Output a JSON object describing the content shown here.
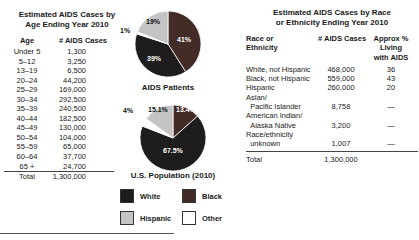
{
  "age_table": {
    "title": "Estimated AIDS Cases by\nAge Ending Year 2010",
    "col_age": "Age",
    "col_cases": "# AIDS Cases",
    "rows": [
      {
        "age": "Under 5",
        "cases": "1,300"
      },
      {
        "age": "5–12",
        "cases": "3,250"
      },
      {
        "age": "13–19",
        "cases": "6,500"
      },
      {
        "age": "20–24",
        "cases": "44,200"
      },
      {
        "age": "25–29",
        "cases": "169,000"
      },
      {
        "age": "30–34",
        "cases": "292,500"
      },
      {
        "age": "35–39",
        "cases": "240,500"
      },
      {
        "age": "40–44",
        "cases": "182,500"
      },
      {
        "age": "45–49",
        "cases": "130,000"
      },
      {
        "age": "50–54",
        "cases": "104,000"
      },
      {
        "age": "55–59",
        "cases": "65,000"
      },
      {
        "age": "60–64",
        "cases": "37,700"
      },
      {
        "age": "65 +",
        "cases": "24,700"
      }
    ],
    "total_label": "Total",
    "total_value": "1,300,000"
  },
  "race_table": {
    "title": "Estimated AIDS Cases by Race\nor Ethnicity Ending Year 2010",
    "col_race": "Race or\nEthnicity",
    "col_cases": "# AIDS Cases",
    "col_pct": "Approx %\nLiving\nwith AIDS",
    "rows": [
      {
        "race": "White, not Hispanic",
        "cases": "468,000",
        "pct": "36"
      },
      {
        "race": "Black, not Hispanic",
        "cases": "559,000",
        "pct": "43"
      },
      {
        "race": "Hispanic",
        "cases": "260,000",
        "pct": "20"
      },
      {
        "race": "Asian/\n  Pacific Islander",
        "cases": "8,758",
        "pct": "—"
      },
      {
        "race": "American Indian/\n  Alaska Native",
        "cases": "3,200",
        "pct": "—"
      },
      {
        "race": "Race/ethnicity\n  unknown",
        "cases": "1,007",
        "pct": "—"
      }
    ],
    "total_label": "Total",
    "total_value": "1,300,000"
  },
  "legend": {
    "items": [
      {
        "label": "White",
        "color": "#1e1c1c"
      },
      {
        "label": "Black",
        "color": "#432b28"
      },
      {
        "label": "Hispanic",
        "color": "#c4c4c4"
      },
      {
        "label": "Other",
        "color": "#ffffff"
      }
    ]
  },
  "chart_data": [
    {
      "type": "pie",
      "title": "AIDS Patients",
      "slices": [
        {
          "label": "Black",
          "value": 41,
          "display": "41%",
          "color": "#432b28"
        },
        {
          "label": "White",
          "value": 39,
          "display": "39%",
          "color": "#1e1c1c"
        },
        {
          "label": "Other",
          "value": 1,
          "display": "1%",
          "color": "#ffffff"
        },
        {
          "label": "Hispanic",
          "value": 19,
          "display": "19%",
          "color": "#c4c4c4"
        }
      ]
    },
    {
      "type": "pie",
      "title": "U.S. Population (2010)",
      "slices": [
        {
          "label": "Black",
          "value": 13.4,
          "display": "13.4%",
          "color": "#432b28"
        },
        {
          "label": "White",
          "value": 67.5,
          "display": "67.5%",
          "color": "#1e1c1c"
        },
        {
          "label": "Other",
          "value": 4,
          "display": "4%",
          "color": "#ffffff"
        },
        {
          "label": "Hispanic",
          "value": 15.1,
          "display": "15.1%",
          "color": "#c4c4c4"
        }
      ]
    }
  ]
}
